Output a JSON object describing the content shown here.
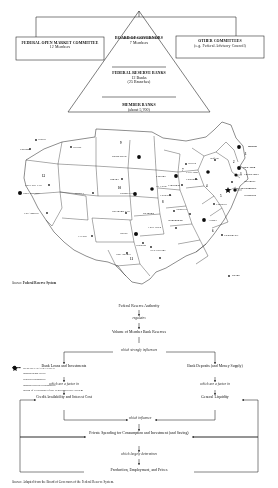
{
  "figure_pyramid": {
    "name": "structure-of-the-federal-reserve-system",
    "left_box": {
      "title": "FEDERAL OPEN MARKET COMMITTEE",
      "subtitle": "12 Members"
    },
    "right_box": {
      "title": "OTHER COMMITTEES",
      "subtitle": "(e.g. Federal Advisory Council)"
    },
    "tiers": [
      {
        "title": "BOARD OF GOVERNORS",
        "subtitle": "7 Members"
      },
      {
        "title": "FEDERAL RESERVE BANKS",
        "subtitle": "12 Banks",
        "subtitle2": "(25 Branches)"
      },
      {
        "title": "MEMBER BANKS",
        "subtitle": "(about 5,700)"
      }
    ]
  },
  "figure_map": {
    "name": "federal-reserve-districts-map",
    "reserve_bank_cities": [
      {
        "label": "Boston",
        "x": 247,
        "y": 30,
        "align": "left"
      },
      {
        "label": "New York",
        "x": 243,
        "y": 51,
        "align": "left"
      },
      {
        "label": "Philadelphia",
        "x": 243,
        "y": 59,
        "align": "left"
      },
      {
        "label": "Cleveland",
        "x": 185,
        "y": 56,
        "align": "right"
      },
      {
        "label": "Richmond",
        "x": 243,
        "y": 74,
        "align": "left"
      },
      {
        "label": "Atlanta",
        "x": 209,
        "y": 204,
        "align": "left"
      },
      {
        "label": "Chicago",
        "x": 155,
        "y": 60,
        "align": "right"
      },
      {
        "label": "St. Louis",
        "x": 158,
        "y": 73,
        "align": "left"
      },
      {
        "label": "Minneapolis",
        "x": 120,
        "y": 41,
        "align": "right"
      },
      {
        "label": "Kansas City",
        "x": 132,
        "y": 77,
        "align": "right"
      },
      {
        "label": "Dallas",
        "x": 126,
        "y": 117,
        "align": "right"
      },
      {
        "label": "San Francisco",
        "x": 22,
        "y": 77,
        "align": "left"
      }
    ],
    "branch_cities": [
      "Seattle",
      "Portland",
      "Helena",
      "Salt Lake City",
      "Denver",
      "Los Angeles",
      "Omaha",
      "Oklahoma City",
      "El Paso",
      "San Antonio",
      "Houston",
      "New Orleans",
      "Little Rock",
      "Memphis",
      "Birmingham",
      "Nashville",
      "Louisville",
      "Cincinnati",
      "Pittsburgh",
      "Detroit",
      "Buffalo",
      "Baltimore",
      "Charlotte",
      "Jacksonville",
      "Miami"
    ],
    "washington_label": "WASHINGTON",
    "district_numbers": [
      "1",
      "2",
      "3",
      "4",
      "5",
      "6",
      "7",
      "8",
      "9",
      "10",
      "11",
      "12"
    ],
    "legend": [
      {
        "mark": "filled-circle",
        "text": "RESERVE BANK CITIES"
      },
      {
        "mark": "small-dot",
        "text": "Branch Bank cities"
      },
      {
        "mark": "dashed-line",
        "text": "District boundaries"
      },
      {
        "mark": "solid-line",
        "text": "Branch territory boundaries"
      },
      {
        "mark": "star",
        "text": "Board of Governors of the Federal Reserve System"
      }
    ],
    "source_label": "Source:",
    "source_text": "Federal Reserve System"
  },
  "figure_flow": {
    "name": "how-federal-reserve-authority-affects-the-economy",
    "nodes": {
      "n1": "Federal Reserve Authority",
      "n2": "Volume of Member Bank Reserves",
      "n3_left": "Bank Loans and Investments",
      "n3_right": "Bank Deposits (and Money Supply)",
      "n4_left": "Credit Availability and Interest Cost",
      "n4_right": "General Liquidity",
      "n5": "Private Spending for Consumption and Investment (and Saving)",
      "n6": "Production, Employment, and Prices"
    },
    "connectors": {
      "c1": "regulates",
      "c2": "which strongly influences",
      "c3_left": "which are a factor in",
      "c3_right": "which are a factor in",
      "c4": "which influence",
      "c5": "which largely determines"
    },
    "source_label": "Source:",
    "source_text": "Adapted from the Board of Governors of the Federal Reserve System."
  }
}
